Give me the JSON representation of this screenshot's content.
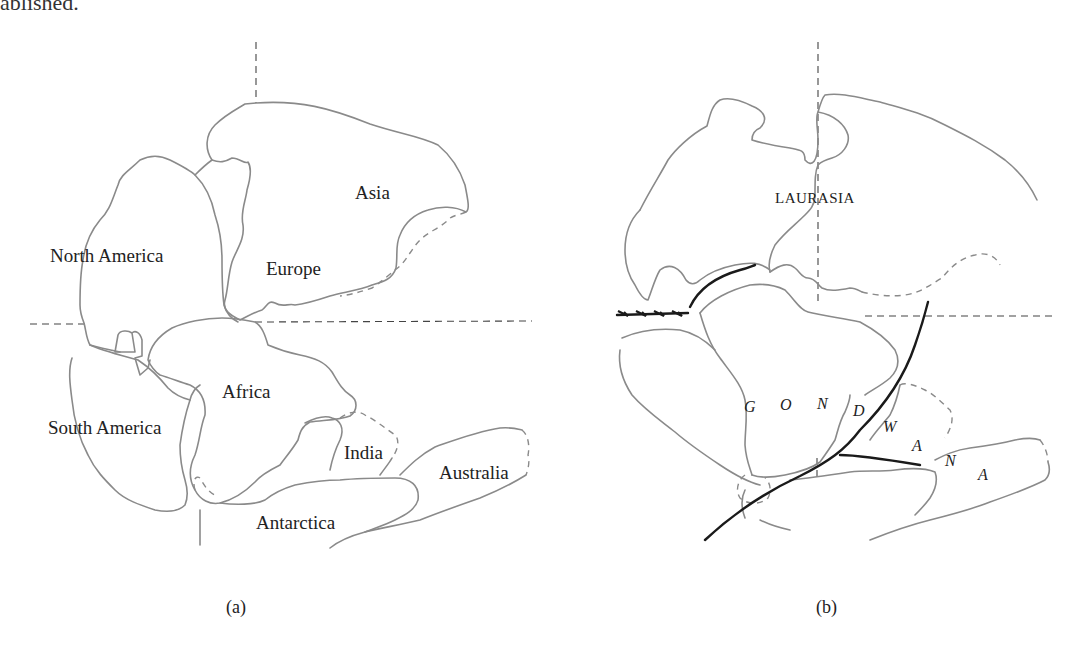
{
  "page": {
    "top_text_fragment": "ablished."
  },
  "panel_a": {
    "caption": "(a)",
    "labels": {
      "north_america": "North America",
      "europe": "Europe",
      "asia": "Asia",
      "africa": "Africa",
      "south_america": "South America",
      "india": "India",
      "australia": "Australia",
      "antarctica": "Antarctica"
    }
  },
  "panel_b": {
    "caption": "(b)",
    "labels": {
      "laurasia": "LAURASIA",
      "gondwana_letters": [
        "G",
        "O",
        "N",
        "D",
        "W",
        "A",
        "N",
        "A"
      ]
    }
  },
  "colors": {
    "coastline": "#8a8a8a",
    "grid_lines": "#444444",
    "orogenic_belts": "#1a1a1a",
    "background": "#ffffff"
  }
}
